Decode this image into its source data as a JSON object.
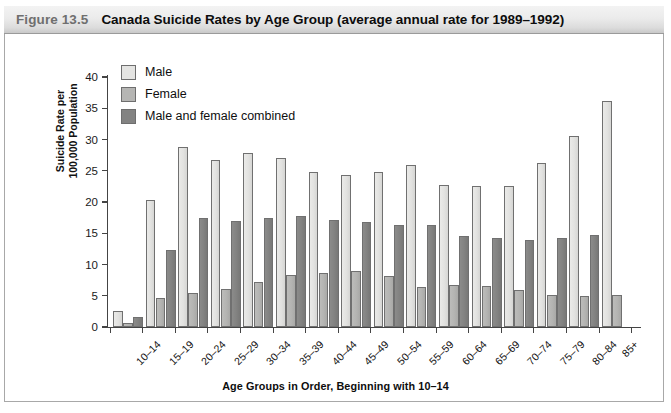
{
  "figure": {
    "number_label": "Figure 13.5",
    "title": "Canada Suicide Rates by Age Group (average annual rate for 1989–1992)"
  },
  "legend": {
    "position": "top-left-inside-plot",
    "items": [
      {
        "label": "Male",
        "color": "#e4e4e2"
      },
      {
        "label": "Female",
        "color": "#b5b5b3"
      },
      {
        "label": "Male and female combined",
        "color": "#838382"
      }
    ]
  },
  "axes": {
    "y_title": "Suicide Rate per\n100,000 Population",
    "x_title": "Age Groups in Order, Beginning with 10–14",
    "y_ticks": [
      "0",
      "5",
      "10",
      "15",
      "20",
      "25",
      "30",
      "35",
      "40"
    ]
  },
  "chart_data": {
    "type": "bar",
    "title": "Canada Suicide Rates by Age Group (average annual rate for 1989–1992)",
    "xlabel": "Age Groups in Order, Beginning with 10–14",
    "ylabel": "Suicide Rate per 100,000 Population",
    "ylim": [
      0,
      40
    ],
    "ytick_step": 5,
    "grid": false,
    "legend_position": "upper left",
    "categories": [
      "10–14",
      "15–19",
      "20–24",
      "25–29",
      "30–34",
      "35–39",
      "40–44",
      "45–49",
      "50–54",
      "55–59",
      "60–64",
      "65–69",
      "70–74",
      "75–79",
      "80–84",
      "85+"
    ],
    "series": [
      {
        "name": "Male",
        "color": "#e4e4e2",
        "values": [
          2.6,
          20.4,
          28.8,
          26.8,
          27.8,
          27.0,
          24.8,
          24.4,
          24.8,
          26.0,
          22.8,
          22.5,
          22.5,
          26.3,
          30.5,
          36.1
        ]
      },
      {
        "name": "Female",
        "color": "#b5b5b3",
        "values": [
          0.7,
          4.6,
          5.4,
          6.1,
          7.2,
          8.4,
          8.7,
          9.0,
          8.1,
          6.4,
          6.8,
          6.6,
          6.0,
          5.1,
          5.0,
          5.1
        ]
      },
      {
        "name": "Male and female combined",
        "color": "#838382",
        "values": [
          1.6,
          12.4,
          17.4,
          17.0,
          17.4,
          17.8,
          17.2,
          16.8,
          16.3,
          16.4,
          14.6,
          14.3,
          13.9,
          14.3,
          14.7,
          null
        ]
      }
    ]
  }
}
